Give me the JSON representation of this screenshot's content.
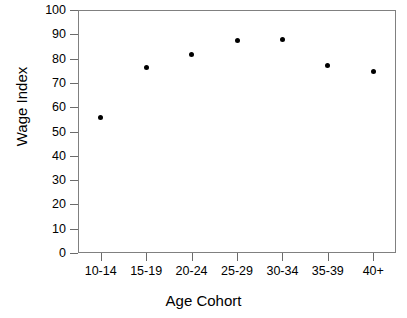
{
  "chart_data": {
    "type": "scatter",
    "title": "",
    "xlabel": "Age Cohort",
    "ylabel": "Wage Index",
    "categories": [
      "10-14",
      "15-19",
      "20-24",
      "25-29",
      "30-34",
      "35-39",
      "40+"
    ],
    "values": [
      55.6,
      76.5,
      81.5,
      87.3,
      87.8,
      77.3,
      74.7
    ],
    "series": [
      {
        "name": "Wage Index",
        "values": [
          55.6,
          76.5,
          81.5,
          87.3,
          87.8,
          77.3,
          74.7
        ]
      }
    ],
    "ylim": [
      0,
      100
    ],
    "y_ticks": [
      0,
      10,
      20,
      30,
      40,
      50,
      60,
      70,
      80,
      90,
      100
    ],
    "y_tick_labels": [
      "0",
      "10",
      "20",
      "30",
      "40",
      "50",
      "60",
      "70",
      "80",
      "90",
      "100"
    ],
    "x_tick_labels": [
      "10-14",
      "15-19",
      "20-24",
      "25-29",
      "30-34",
      "35-39",
      "40+"
    ],
    "grid": false,
    "legend": false,
    "marker": "filled-circle",
    "marker_color": "#000000",
    "frame_color": "#808080",
    "background": "#ffffff"
  },
  "axes": {
    "y_title": "Wage Index",
    "x_title": "Age Cohort"
  }
}
